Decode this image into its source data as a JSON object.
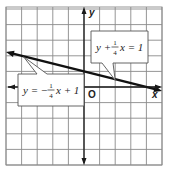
{
  "chart_data": {
    "type": "line",
    "title": "",
    "xlabel": "x",
    "ylabel": "y",
    "origin_label": "O",
    "xlim": [
      -5,
      5
    ],
    "ylim": [
      -5.5,
      5.5
    ],
    "grid": true,
    "tick_labels": false,
    "series": [
      {
        "name": "y = -1/4 x + 1",
        "slope": -0.25,
        "intercept": 1,
        "x": [
          -5,
          5
        ],
        "y": [
          2.25,
          -0.25
        ]
      }
    ],
    "annotations": [
      {
        "id": "eq1",
        "text_parts": [
          "y +",
          "1",
          "4",
          "x = 1"
        ],
        "text": "y + 1/4 x = 1",
        "points_to": [
          2,
          0.5
        ]
      },
      {
        "id": "eq2",
        "text_parts": [
          "y = −",
          "1",
          "4",
          "x + 1"
        ],
        "text": "y = -1/4 x + 1",
        "points_to": [
          -4,
          2
        ]
      }
    ]
  }
}
